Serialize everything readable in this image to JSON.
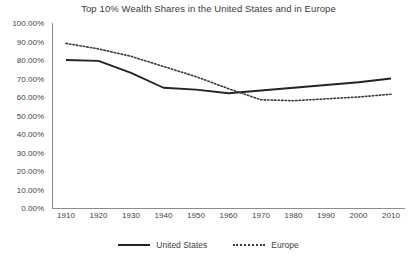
{
  "chart_data": {
    "type": "line",
    "title": "Top 10% Wealth Shares in the United States and in Europe",
    "xlabel": "",
    "ylabel": "",
    "x": [
      1910,
      1920,
      1930,
      1940,
      1950,
      1960,
      1970,
      1980,
      1990,
      2000,
      2010
    ],
    "xtick_labels": [
      "1910",
      "1920",
      "1930",
      "1940",
      "1950",
      "1960",
      "1970",
      "1980",
      "1990",
      "2000",
      "2010"
    ],
    "ytick_labels": [
      "0.00%",
      "10.00%",
      "20.00%",
      "30.00%",
      "40.00%",
      "50.00%",
      "60.00%",
      "70.00%",
      "80.00%",
      "90.00%",
      "100.00%"
    ],
    "ytick_values": [
      0,
      10,
      20,
      30,
      40,
      50,
      60,
      70,
      80,
      90,
      100
    ],
    "ylim": [
      0,
      100
    ],
    "xlim": [
      1910,
      2010
    ],
    "grid": false,
    "legend_position": "bottom",
    "series": [
      {
        "name": "United States",
        "style": "solid",
        "color": "#242424",
        "values": [
          80.0,
          79.5,
          73.0,
          65.0,
          64.0,
          62.0,
          63.5,
          65.0,
          66.5,
          68.0,
          70.0
        ]
      },
      {
        "name": "Europe",
        "style": "dotted",
        "color": "#3a3a3a",
        "values": [
          89.0,
          86.0,
          82.0,
          76.5,
          71.0,
          64.5,
          58.5,
          58.0,
          59.0,
          60.0,
          61.5
        ]
      }
    ]
  }
}
